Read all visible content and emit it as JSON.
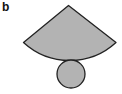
{
  "panel": {
    "label": "b"
  },
  "figure": {
    "shapes": [
      {
        "name": "sector",
        "apex": [
          68.5,
          5.5
        ],
        "left": [
          23.5,
          42.5
        ],
        "right": [
          116,
          42.5
        ],
        "arc_bottom_y": 60.5
      },
      {
        "name": "base-circle",
        "cx": 71,
        "cy": 74,
        "r": 14
      }
    ],
    "colors": {
      "fill": "#b3b3b3",
      "stroke": "#222222",
      "background": "#ffffff"
    }
  }
}
